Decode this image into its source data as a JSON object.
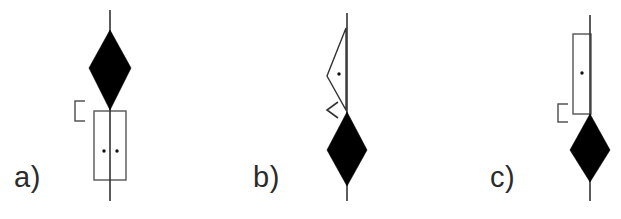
{
  "figure": {
    "type": "technical-line-diagram",
    "width": 621,
    "height": 219,
    "background_color": "#ffffff",
    "stroke_color": "#333333",
    "fill_color": "#000000",
    "panel_count": 3
  },
  "panels": [
    {
      "id": "a",
      "label": "a)",
      "label_x": 14,
      "label_y": 163,
      "axis": {
        "x": 110,
        "y_top": 10,
        "y_bottom": 201
      },
      "diamond": {
        "center_x": 110,
        "top_y": 30,
        "bottom_y": 110,
        "half_width": 21,
        "waist_y": 68,
        "fill": "#000000"
      },
      "outline_shape": {
        "kind": "rectangle",
        "left": 94,
        "top": 111,
        "right": 126,
        "bottom": 180,
        "stroke": "#555555"
      },
      "dots": [
        {
          "x": 104,
          "y": 151
        },
        {
          "x": 117,
          "y": 151
        }
      ],
      "bracket": {
        "kind": "left-square-bracket",
        "x_left": 75,
        "x_right": 85,
        "y_top": 101,
        "y_bottom": 121,
        "stroke": "#555555"
      },
      "chevron": null
    },
    {
      "id": "b",
      "label": "b)",
      "label_x": 253,
      "label_y": 163,
      "axis": {
        "x": 347,
        "y_top": 13,
        "y_bottom": 201
      },
      "diamond": {
        "center_x": 347,
        "top_y": 112,
        "bottom_y": 186,
        "half_width": 20,
        "waist_y": 150,
        "fill": "#000000"
      },
      "outline_shape": {
        "kind": "triangle",
        "apex_x": 327,
        "apex_y": 76,
        "top_x": 346,
        "top_y": 28,
        "bottom_x": 346,
        "bottom_y": 110,
        "stroke": "#333333"
      },
      "dots": [
        {
          "x": 339,
          "y": 74
        }
      ],
      "bracket": null,
      "chevron": {
        "kind": "left-chevron",
        "x_right": 338,
        "x_left": 327,
        "y_top": 102,
        "y_bottom": 118,
        "stroke": "#333333"
      }
    },
    {
      "id": "c",
      "label": "c)",
      "label_x": 490,
      "label_y": 163,
      "axis": {
        "x": 590,
        "y_top": 15,
        "y_bottom": 201
      },
      "diamond": {
        "center_x": 590,
        "top_y": 114,
        "bottom_y": 182,
        "half_width": 20,
        "waist_y": 150,
        "fill": "#000000"
      },
      "outline_shape": {
        "kind": "rectangle",
        "left": 573,
        "top": 34,
        "right": 591,
        "bottom": 114,
        "stroke": "#555555"
      },
      "dots": [
        {
          "x": 582,
          "y": 73
        }
      ],
      "bracket": {
        "kind": "left-square-bracket",
        "x_left": 558,
        "x_right": 568,
        "y_top": 104,
        "y_bottom": 122,
        "stroke": "#555555"
      },
      "chevron": null
    }
  ]
}
